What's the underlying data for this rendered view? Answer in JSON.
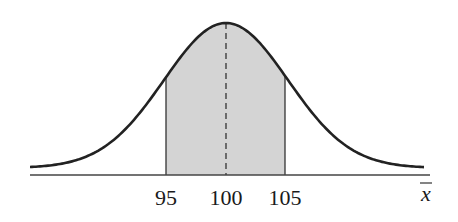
{
  "diagram": {
    "type": "normal-distribution",
    "mean": 100,
    "shaded_interval": [
      95,
      105
    ],
    "tick_labels": [
      "95",
      "100",
      "105"
    ],
    "axis_variable": "x",
    "axis_variable_bar": true,
    "mean_line_style": "dashed",
    "colors": {
      "curve": "#222222",
      "axis": "#444444",
      "shade": "#d4d4d4",
      "text": "#1a1a1a"
    }
  }
}
